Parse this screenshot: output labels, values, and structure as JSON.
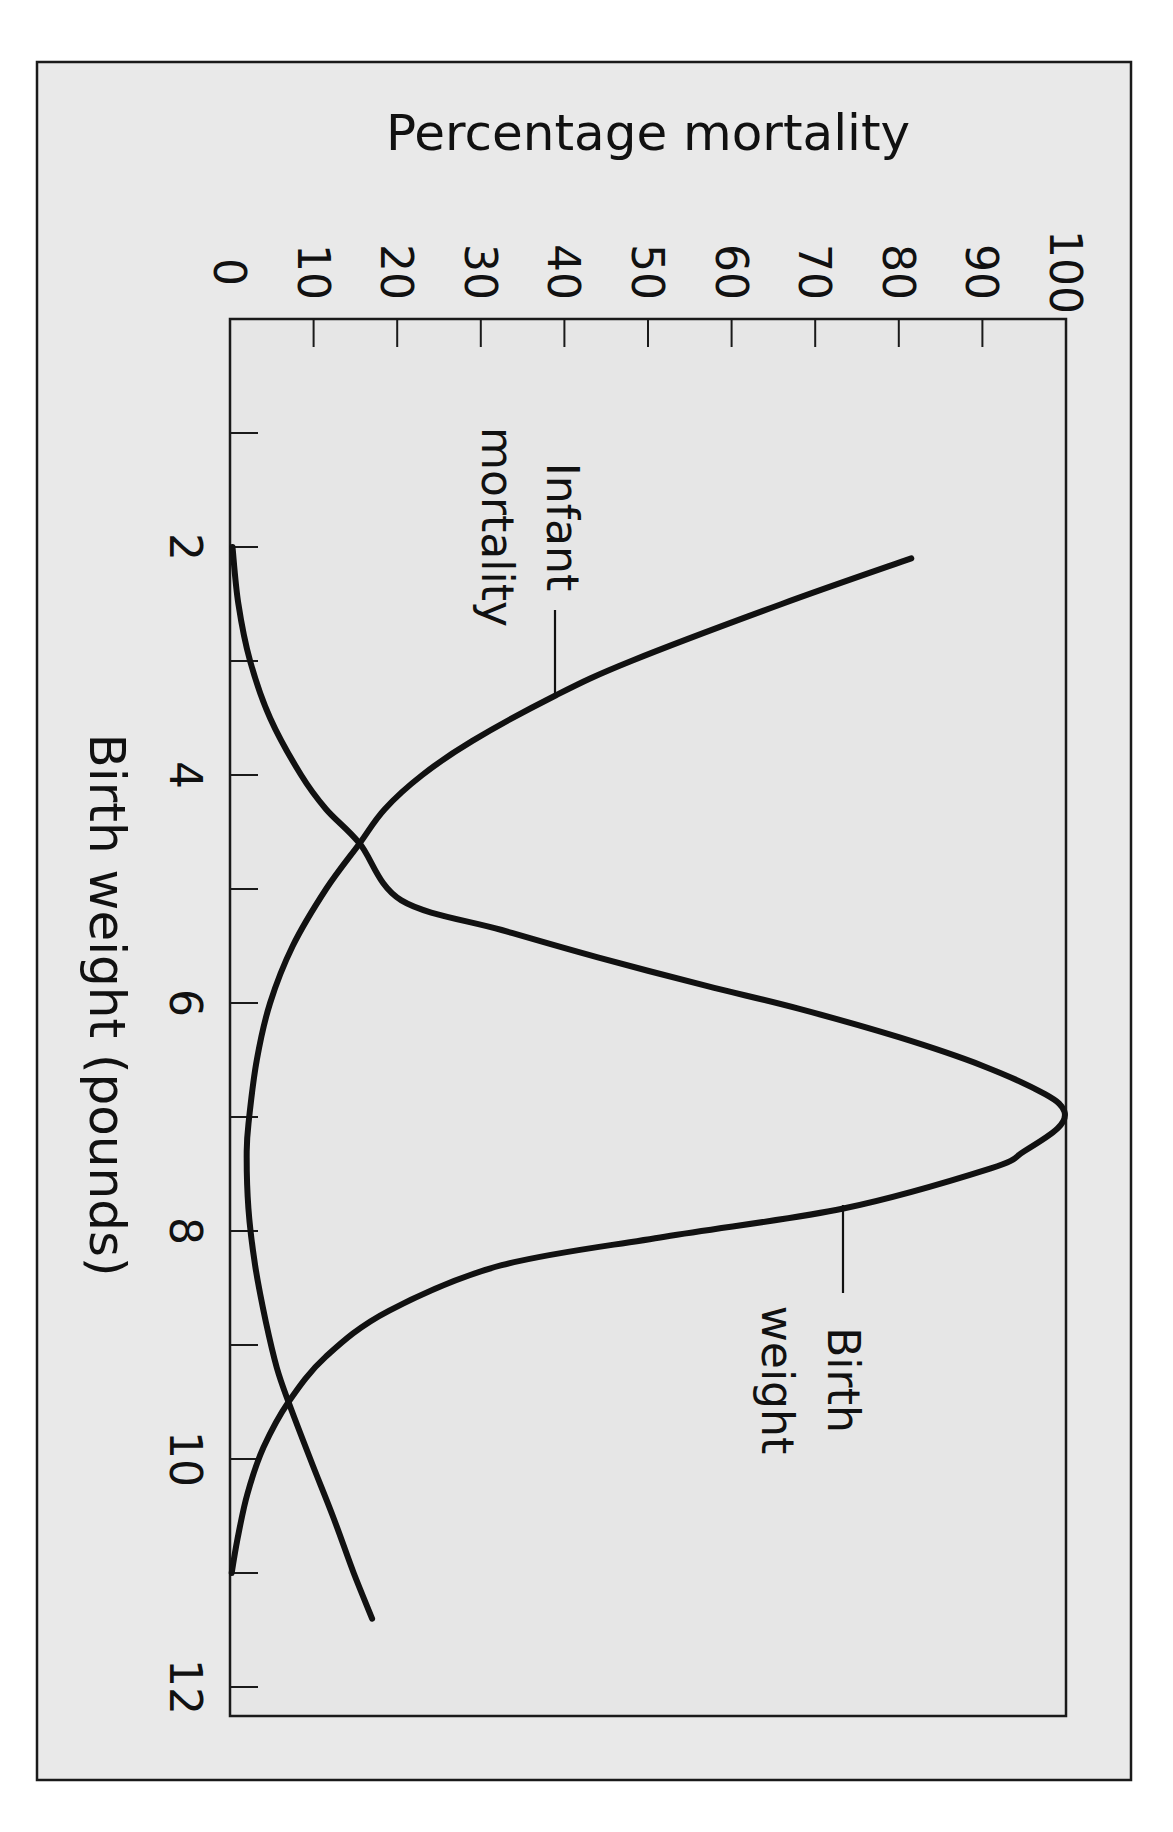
{
  "figure": {
    "orientation": "rotated-90-clockwise"
  },
  "chart_data": {
    "type": "line",
    "title": "",
    "xlabel": "Birth weight (pounds)",
    "ylabel": "Percentage mortality",
    "xlim": [
      0,
      12
    ],
    "ylim": [
      0,
      100
    ],
    "x_ticks": [
      1,
      2,
      3,
      4,
      5,
      6,
      7,
      8,
      9,
      10,
      11,
      12
    ],
    "x_tick_labels": [
      {
        "value": 2,
        "label": "2"
      },
      {
        "value": 4,
        "label": "4"
      },
      {
        "value": 6,
        "label": "6"
      },
      {
        "value": 8,
        "label": "8"
      },
      {
        "value": 10,
        "label": "10"
      },
      {
        "value": 12,
        "label": "12"
      }
    ],
    "y_ticks": [
      10,
      20,
      30,
      40,
      50,
      60,
      70,
      80,
      90
    ],
    "y_tick_labels": [
      {
        "value": 0,
        "label": "0"
      },
      {
        "value": 10,
        "label": "10"
      },
      {
        "value": 20,
        "label": "20"
      },
      {
        "value": 30,
        "label": "30"
      },
      {
        "value": 40,
        "label": "40"
      },
      {
        "value": 50,
        "label": "50"
      },
      {
        "value": 60,
        "label": "60"
      },
      {
        "value": 70,
        "label": "70"
      },
      {
        "value": 80,
        "label": "80"
      },
      {
        "value": 90,
        "label": "90"
      },
      {
        "value": 100,
        "label": "100"
      }
    ],
    "grid": false,
    "legend": "none (inline annotations)",
    "series": [
      {
        "name": "Infant mortality",
        "label_lines": [
          "Infant",
          "mortality"
        ],
        "points": [
          [
            2.1,
            81.5
          ],
          [
            2.5,
            66
          ],
          [
            3.0,
            48
          ],
          [
            3.3,
            39
          ],
          [
            3.7,
            29
          ],
          [
            4.0,
            23
          ],
          [
            4.3,
            18.5
          ],
          [
            4.6,
            15.5
          ],
          [
            5.0,
            11.5
          ],
          [
            5.5,
            7.5
          ],
          [
            6.0,
            4.8
          ],
          [
            6.5,
            3.2
          ],
          [
            7.0,
            2.3
          ],
          [
            7.3,
            2.0
          ],
          [
            7.8,
            2.2
          ],
          [
            8.3,
            3.0
          ],
          [
            8.8,
            4.3
          ],
          [
            9.2,
            5.6
          ],
          [
            9.5,
            7.0
          ],
          [
            10.0,
            9.6
          ],
          [
            10.5,
            12.3
          ],
          [
            11.0,
            14.8
          ],
          [
            11.4,
            17.0
          ]
        ]
      },
      {
        "name": "Birth weight",
        "label_lines": [
          "Birth",
          "weight"
        ],
        "points": [
          [
            2.0,
            0.3
          ],
          [
            2.5,
            1.0
          ],
          [
            3.0,
            2.4
          ],
          [
            3.5,
            4.8
          ],
          [
            4.0,
            8.5
          ],
          [
            4.3,
            11.5
          ],
          [
            4.6,
            15.5
          ],
          [
            5.1,
            20.5
          ],
          [
            5.36,
            32.5
          ],
          [
            5.6,
            44
          ],
          [
            5.85,
            57
          ],
          [
            6.05,
            68
          ],
          [
            6.3,
            80
          ],
          [
            6.55,
            90
          ],
          [
            6.8,
            97.5
          ],
          [
            6.95,
            99.8
          ],
          [
            7.1,
            99
          ],
          [
            7.3,
            95
          ],
          [
            7.45,
            91
          ],
          [
            7.8,
            73.5
          ],
          [
            8.05,
            52
          ],
          [
            8.3,
            32.5
          ],
          [
            8.7,
            19
          ],
          [
            9.1,
            11.5
          ],
          [
            9.5,
            7.0
          ],
          [
            9.9,
            4.0
          ],
          [
            10.3,
            2.1
          ],
          [
            10.7,
            0.9
          ],
          [
            11.0,
            0.2
          ]
        ]
      }
    ],
    "annotations": [
      {
        "text": "Infant mortality",
        "attached_to": "Infant mortality",
        "at": [
          3.3,
          39
        ]
      },
      {
        "text": "Birth weight",
        "attached_to": "Birth weight",
        "at": [
          7.8,
          73.5
        ]
      }
    ]
  }
}
